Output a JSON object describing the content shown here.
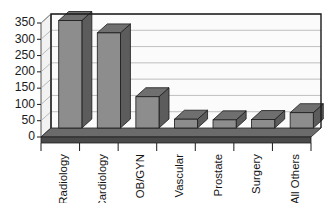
{
  "chart_data": {
    "type": "bar",
    "title": "",
    "subtitle": "",
    "xlabel": "",
    "ylabel": "",
    "categories": [
      "Radiology",
      "Cardiology",
      "OB/GYN",
      "Vascular",
      "Prostate",
      "Surgery",
      "All Others"
    ],
    "values": [
      330,
      292,
      96,
      27,
      25,
      26,
      47
    ],
    "ylim": [
      0,
      350
    ],
    "yticks": [
      0,
      50,
      100,
      150,
      200,
      250,
      300,
      350
    ],
    "ytick_labels": [
      "0",
      "50",
      "100",
      "150",
      "200",
      "250",
      "300",
      "350"
    ],
    "grid": true,
    "legend": false,
    "legend_position": "none",
    "style": "3d-column",
    "colors": {
      "bar_front": "#8d8d8d",
      "bar_side": "#5c5c5c",
      "bar_top": "#6f6f6f",
      "bar_outline": "#1a1a1a",
      "plot_background": "#fbfbfb",
      "wall_left": "#f2f2f2",
      "floor": "#4a4a4a",
      "floor_top": "#6b6b6b",
      "gridline": "#b9b9b9",
      "frame": "#1a1a1a",
      "text": "#1b1b1b"
    }
  },
  "axis": {
    "y_tick_labels": [
      "350",
      "300",
      "250",
      "200",
      "150",
      "100",
      "50",
      "0"
    ],
    "category_labels": [
      "Radiology",
      "Cardiology",
      "OB/GYN",
      "Vascular",
      "Prostate",
      "Surgery",
      "All Others"
    ]
  }
}
